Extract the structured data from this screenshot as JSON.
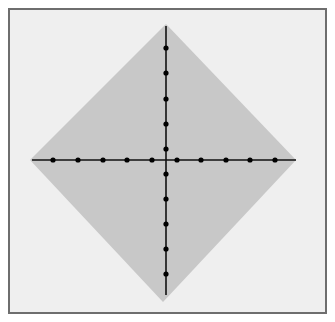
{
  "figure": {
    "colors": {
      "page_background": "#ffffff",
      "frame_border": "#6e6e6e",
      "frame_background": "#efefef",
      "diamond_fill": "#c8c8c8",
      "line_color": "#111111",
      "dot_color": "#000000"
    },
    "frame": {
      "x": 8,
      "y": 8,
      "width": 319,
      "height": 306
    },
    "diamond": {
      "top": [
        166,
        24
      ],
      "right": [
        296,
        160
      ],
      "bottom": [
        163,
        302
      ],
      "left": [
        30,
        160
      ]
    },
    "center": [
      166,
      160
    ],
    "horizontal_line": {
      "x1": 32,
      "x2": 296,
      "y": 160
    },
    "vertical_line": {
      "x": 166,
      "y1": 26,
      "y2": 295
    },
    "horizontal_dots_x": [
      53,
      78,
      103,
      127,
      152,
      177,
      201,
      226,
      250,
      275
    ],
    "vertical_dots_y": [
      48,
      73,
      99,
      124,
      149,
      174,
      199,
      224,
      249,
      274
    ],
    "dot_radius": 2.6,
    "dots_per_half_axis": 5
  }
}
